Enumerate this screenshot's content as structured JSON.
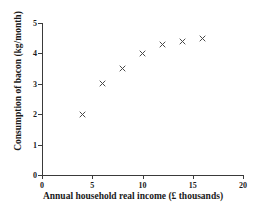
{
  "chart_data": {
    "type": "scatter",
    "title": "",
    "xlabel": "Annual household real income (£ thousands)",
    "ylabel": "Consumption of bacon (kg/month)",
    "xlim": [
      0,
      20
    ],
    "ylim": [
      0,
      5
    ],
    "xticks": [
      "0",
      "5",
      "10",
      "15",
      "20"
    ],
    "xtick_values": [
      0,
      5,
      10,
      15,
      20
    ],
    "yticks": [
      "0",
      "1",
      "2",
      "3",
      "4",
      "5"
    ],
    "ytick_values": [
      0,
      1,
      2,
      3,
      4,
      5
    ],
    "grid": false,
    "legend": null,
    "marker": "x-cross",
    "marker_color": "#4a4a4a",
    "axis_color": "#3a3a3a",
    "x": [
      4,
      6,
      8,
      10,
      12,
      14,
      16
    ],
    "values": [
      2,
      3,
      3.5,
      4,
      4.3,
      4.4,
      4.5
    ],
    "points": [
      {
        "x": 4,
        "y": 2
      },
      {
        "x": 6,
        "y": 3
      },
      {
        "x": 8,
        "y": 3.5
      },
      {
        "x": 10,
        "y": 4
      },
      {
        "x": 12,
        "y": 4.3
      },
      {
        "x": 14,
        "y": 4.4
      },
      {
        "x": 16,
        "y": 4.5
      }
    ]
  }
}
